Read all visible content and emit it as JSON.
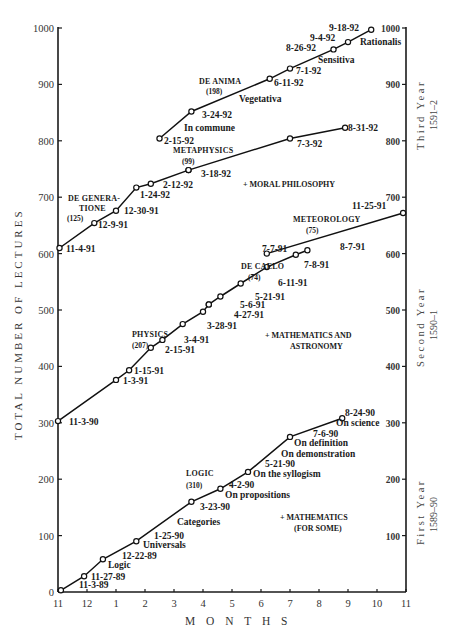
{
  "chart_data": {
    "type": "line",
    "title": "",
    "xlabel": "MONTHS",
    "ylabel": "TOTAL NUMBER OF LECTURES",
    "ylim": [
      0,
      1000
    ],
    "yticks": [
      0,
      100,
      200,
      300,
      400,
      500,
      600,
      700,
      800,
      900,
      1000
    ],
    "right_yticks": [
      100,
      200,
      300,
      400,
      500,
      600,
      700,
      800,
      900,
      1000
    ],
    "xtick_labels": [
      "11",
      "12",
      "1",
      "2",
      "3",
      "4",
      "5",
      "6",
      "7",
      "8",
      "9",
      "10",
      "11"
    ],
    "grid": false,
    "year_bands": [
      {
        "label": "First Year",
        "range": "1589–90",
        "ymin": 0,
        "ymax": 330
      },
      {
        "label": "Second Year",
        "range": "1590–1",
        "ymin": 300,
        "ymax": 680
      },
      {
        "label": "Third Year",
        "range": "1591–2",
        "ymin": 610,
        "ymax": 1000
      }
    ],
    "series": [
      {
        "name": "LOGIC",
        "count": "(310)",
        "points": [
          {
            "x": 0.1,
            "y": 3,
            "date": "11-3-89"
          },
          {
            "x": 0.9,
            "y": 28,
            "date": "11-27-89"
          },
          {
            "x": 1.55,
            "y": 58,
            "date": ""
          },
          {
            "x": 2.7,
            "y": 90,
            "date": "12-22-89"
          },
          {
            "x": 4.6,
            "y": 160,
            "date": "3-23-90"
          },
          {
            "x": 5.6,
            "y": 183,
            "date": "4-2-90"
          },
          {
            "x": 6.55,
            "y": 213,
            "date": "5-21-90"
          },
          {
            "x": 8.0,
            "y": 275,
            "date": "7-6-90"
          },
          {
            "x": 9.8,
            "y": 308,
            "date": "8-24-90"
          }
        ],
        "topics": [
          "Logic",
          "Universals",
          "1-25-90",
          "Categories",
          "On propositions",
          "On the syllogism",
          "On demonstration",
          "On definition",
          "On science"
        ],
        "extra": "+ MATHEMATICS (FOR SOME)"
      },
      {
        "name": "PHYSICS",
        "count": "(207)",
        "points": [
          {
            "x": 0.0,
            "y": 303,
            "date": "11-3-90"
          },
          {
            "x": 2.0,
            "y": 376,
            "date": "1-3-91"
          },
          {
            "x": 2.45,
            "y": 393,
            "date": "1-15-91"
          },
          {
            "x": 3.2,
            "y": 433,
            "date": "2-15-91"
          },
          {
            "x": 3.6,
            "y": 447,
            "date": "3-4-91"
          },
          {
            "x": 4.3,
            "y": 475,
            "date": "3-28-91"
          },
          {
            "x": 5.0,
            "y": 497,
            "date": "4-27-91"
          },
          {
            "x": 5.2,
            "y": 510,
            "date": "5-6-91"
          }
        ],
        "extra": "+ MATHEMATICS AND ASTRONOMY"
      },
      {
        "name": "DE CAELO",
        "count": "(74)",
        "points": [
          {
            "x": 5.2,
            "y": 510,
            "date": "5-6-91"
          },
          {
            "x": 5.6,
            "y": 524,
            "date": "5-21-91"
          },
          {
            "x": 6.3,
            "y": 547,
            "date": "6-11-91"
          },
          {
            "x": 7.2,
            "y": 576,
            "date": "7-8-91"
          },
          {
            "x": 8.2,
            "y": 598,
            "date": "8-7-91",
            "unlabeled": true
          },
          {
            "x": 8.6,
            "y": 606,
            "date": "8-7-91"
          }
        ]
      },
      {
        "name": "METEOROLOGY",
        "count": "(75)",
        "points": [
          {
            "x": 7.2,
            "y": 600,
            "date": "7-7-91"
          },
          {
            "x": 11.9,
            "y": 672,
            "date": "11-25-91"
          }
        ]
      },
      {
        "name": "DE GENERATIONE",
        "count": "(125)",
        "points": [
          {
            "x": 0.05,
            "y": 610,
            "date": "11-4-91"
          },
          {
            "x": 1.25,
            "y": 654,
            "date": "12-9-91"
          },
          {
            "x": 2.0,
            "y": 676,
            "date": "12-30-91"
          },
          {
            "x": 2.7,
            "y": 717,
            "date": "1-24-92"
          },
          {
            "x": 3.2,
            "y": 724,
            "date": "2-12-92"
          },
          {
            "x": 4.5,
            "y": 748,
            "date": "3-18-92"
          }
        ]
      },
      {
        "name": "METAPHYSICS",
        "count": "(99)",
        "points": [
          {
            "x": 4.5,
            "y": 748,
            "date": "3-18-92"
          },
          {
            "x": 8.0,
            "y": 804,
            "date": "7-3-92"
          },
          {
            "x": 9.9,
            "y": 823,
            "date": "8-31-92"
          }
        ],
        "extra": "+ MORAL PHILOSOPHY"
      },
      {
        "name": "DE ANIMA",
        "count": "(198)",
        "points": [
          {
            "x": 3.5,
            "y": 804,
            "date": "2-15-92"
          },
          {
            "x": 4.6,
            "y": 852,
            "date": "3-24-92"
          },
          {
            "x": 7.3,
            "y": 910,
            "date": "6-11-92"
          },
          {
            "x": 8.0,
            "y": 928,
            "date": "7-1-92"
          },
          {
            "x": 9.5,
            "y": 962,
            "date": "8-26-92"
          },
          {
            "x": 10.0,
            "y": 975,
            "date": "9-4-92"
          },
          {
            "x": 10.8,
            "y": 997,
            "date": "9-18-92"
          }
        ],
        "topics": [
          "In commune",
          "Vegetativa",
          "Sensitiva",
          "Rationalis"
        ]
      }
    ]
  },
  "axes": {
    "ylabel": "TOTAL NUMBER OF LECTURES",
    "xlabel": "M O N T H S",
    "left_ticks": [
      "0",
      "100",
      "200",
      "300",
      "400",
      "500",
      "600",
      "700",
      "800",
      "900",
      "1000"
    ],
    "right_ticks": [
      "100",
      "200",
      "300",
      "400",
      "500",
      "600",
      "700",
      "800",
      "900",
      "1000"
    ],
    "month_ticks": [
      "11",
      "12",
      "1",
      "2",
      "3",
      "4",
      "5",
      "6",
      "7",
      "8",
      "9",
      "10",
      "11"
    ]
  },
  "years": {
    "first": {
      "label": "First Year",
      "range": "1589–90"
    },
    "second": {
      "label": "Second Year",
      "range": "1590–1"
    },
    "third": {
      "label": "Third Year",
      "range": "1591–2"
    }
  },
  "subjects": {
    "logic": {
      "title": "LOGIC",
      "count": "(310)",
      "extra1": "+ MATHEMATICS",
      "extra2": "(FOR SOME)"
    },
    "physics": {
      "title": "PHYSICS",
      "count": "(207)",
      "extra1": "+ MATHEMATICS AND",
      "extra2": "ASTRONOMY"
    },
    "de_caelo": {
      "title": "DE CAELO",
      "count": "(74)"
    },
    "meteorology": {
      "title": "METEOROLOGY",
      "count": "(75)"
    },
    "de_generatione": {
      "title1": "DE GENERA-",
      "title2": "TIONE",
      "count": "(125)"
    },
    "metaphysics": {
      "title": "METAPHYSICS",
      "count": "(99)",
      "extra": "+ MORAL PHILOSOPHY"
    },
    "de_anima": {
      "title": "DE ANIMA",
      "count": "(198)"
    }
  },
  "labels": {
    "logic": {
      "d1": "11-3-89",
      "d2": "11-27-89",
      "t1": "Logic",
      "d3": "12-22-89",
      "t2": "Universals",
      "d4": "1-25-90",
      "t3": "Categories",
      "d5": "3-23-90",
      "d6": "4-2-90",
      "t4": "On propositions",
      "d7": "5-21-90",
      "t5": "On the syllogism",
      "t6": "On demonstration",
      "t7": "On definition",
      "d8": "7-6-90",
      "d9": "8-24-90",
      "t8": "On science"
    },
    "physics": {
      "d1": "11-3-90",
      "d2": "1-3-91",
      "d3": "1-15-91",
      "d4": "2-15-91",
      "d5": "3-4-91",
      "d6": "3-28-91",
      "d7": "4-27-91",
      "d8": "5-6-91"
    },
    "de_caelo": {
      "d1": "5-21-91",
      "d2": "6-11-91",
      "d3": "7-8-91",
      "d4": "8-7-91"
    },
    "meteorology": {
      "d1": "7-7-91",
      "d2": "11-25-91"
    },
    "de_generatione": {
      "d1": "11-4-91",
      "d2": "12-9-91",
      "d3": "12-30-91",
      "d4": "1-24-92",
      "d5": "2-12-92",
      "d6": "3-18-92"
    },
    "metaphysics": {
      "d1": "7-3-92",
      "d2": "8-31-92"
    },
    "de_anima": {
      "d1": "2-15-92",
      "d2": "3-24-92",
      "t1": "In commune",
      "t2": "Vegetativa",
      "d3": "6-11-92",
      "d4": "7-1-92",
      "d5": "8-26-92",
      "t3": "Sensitiva",
      "d6": "9-4-92",
      "d7": "9-18-92",
      "t4": "Rationalis"
    }
  }
}
